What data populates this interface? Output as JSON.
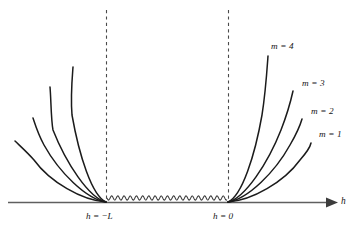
{
  "figure": {
    "background_color": "#ffffff",
    "curve_color": "#1b1b1b",
    "axis_color": "#5f5f5f",
    "dashed_color": "#4a4a4a",
    "wavy_color": "#3a3a3a",
    "axis_label": "h",
    "tick_labels": [
      {
        "text": "h = −L",
        "x": 106
      },
      {
        "text": "h = 0",
        "x": 228
      }
    ],
    "curve_labels": [
      {
        "text": "m = 4",
        "x": 271,
        "y": 42
      },
      {
        "text": "m = 3",
        "x": 302,
        "y": 79
      },
      {
        "text": "m = 2",
        "x": 311,
        "y": 107
      },
      {
        "text": "m = 1",
        "x": 319,
        "y": 130
      }
    ]
  },
  "chart_data": {
    "type": "line",
    "title": "",
    "subtitle": "",
    "xlabel": "h",
    "ylabel": "",
    "grid": false,
    "legend_position": "inline-right-of-curves",
    "axis": {
      "x_start_px": 8,
      "x_end_px": 338,
      "baseline_y_px": 202,
      "arrow_at_right": true
    },
    "markers": [
      {
        "label": "h = −L",
        "x_px": 106,
        "dashed_vertical": true,
        "dash_top_y_px": 10
      },
      {
        "label": "h = 0",
        "x_px": 228,
        "dashed_vertical": true,
        "dash_top_y_px": 10
      }
    ],
    "wavy_segment": {
      "description": "small-amplitude sinusoidal line connecting h = -L and h = 0 just above the axis",
      "x_from_px": 107,
      "x_to_px": 227,
      "y_center_px": 198,
      "amplitude_px": 2.1,
      "period_px": 6.2
    },
    "series": [
      {
        "name": "m = 1",
        "side": "right",
        "label": "m = 1",
        "label_x_px": 319,
        "label_y_px": 130,
        "origin_x_px": 228,
        "origin_y_px": 202,
        "end_x_px": 311,
        "end_y_px": 143,
        "steepness": 1
      },
      {
        "name": "m = 2",
        "side": "right",
        "label": "m = 2",
        "label_x_px": 311,
        "label_y_px": 107,
        "origin_x_px": 228,
        "origin_y_px": 202,
        "end_x_px": 302,
        "end_y_px": 119,
        "steepness": 2
      },
      {
        "name": "m = 3",
        "side": "right",
        "label": "m = 3",
        "label_x_px": 302,
        "label_y_px": 79,
        "origin_x_px": 228,
        "origin_y_px": 202,
        "end_x_px": 293,
        "end_y_px": 91,
        "steepness": 3
      },
      {
        "name": "m = 4",
        "side": "right",
        "label": "m = 4",
        "label_x_px": 271,
        "label_y_px": 42,
        "origin_x_px": 228,
        "origin_y_px": 202,
        "end_x_px": 268,
        "end_y_px": 56,
        "steepness": 4
      },
      {
        "name": "m = 1 (mirror)",
        "side": "left",
        "label": "",
        "origin_x_px": 106,
        "origin_y_px": 202,
        "end_x_px": 15,
        "end_y_px": 141,
        "steepness": 1
      },
      {
        "name": "m = 2 (mirror)",
        "side": "left",
        "label": "",
        "origin_x_px": 106,
        "origin_y_px": 202,
        "end_x_px": 33,
        "end_y_px": 118,
        "steepness": 2
      },
      {
        "name": "m = 3 (mirror)",
        "side": "left",
        "label": "",
        "origin_x_px": 106,
        "origin_y_px": 202,
        "end_x_px": 50,
        "end_y_px": 87,
        "steepness": 3
      },
      {
        "name": "m = 4 (mirror)",
        "side": "left",
        "label": "",
        "origin_x_px": 106,
        "origin_y_px": 202,
        "end_x_px": 73,
        "end_y_px": 67,
        "steepness": 4
      }
    ]
  }
}
